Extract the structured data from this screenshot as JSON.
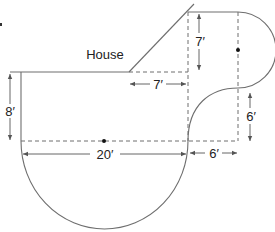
{
  "diagram": {
    "type": "floor-plan / patio area figure",
    "labels": {
      "house": "House",
      "dim_left_height": "8′",
      "dim_bottom_diameter": "20′",
      "dim_top_height": "7′",
      "dim_top_width": "7′",
      "dim_right_height": "6′",
      "dim_right_width": "6′"
    },
    "shapes": [
      {
        "name": "semicircle-bottom",
        "diameter": "20′"
      },
      {
        "name": "rectangle-left",
        "width": "20′",
        "height": "8′"
      },
      {
        "name": "triangle",
        "legs": [
          "7′",
          "7′"
        ]
      },
      {
        "name": "rectangle-right",
        "width": "6′",
        "height": "13′"
      },
      {
        "name": "semicircle-right",
        "diameter": "13′"
      },
      {
        "name": "quarter-circle-cutout",
        "radius": "6′"
      }
    ],
    "colors": {
      "line": "#6e6e6e",
      "text": "#222222"
    }
  }
}
